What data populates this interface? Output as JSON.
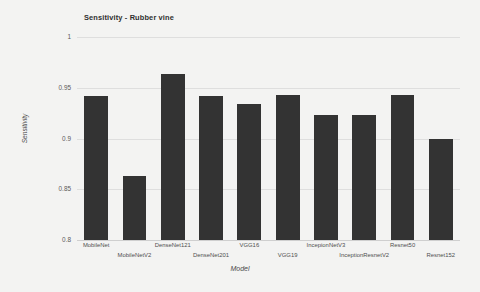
{
  "chart_data": {
    "type": "bar",
    "title": "Sensitivity - Rubber vine",
    "xlabel": "Model",
    "ylabel": "Sensitivity",
    "ylim": [
      0.8,
      1
    ],
    "yticks": [
      "0.8",
      "0.85",
      "0.9",
      "0.95",
      "1"
    ],
    "ytick_values": [
      0.8,
      0.85,
      0.9,
      0.95,
      1
    ],
    "grid": true,
    "legend": "none",
    "bar_color": "#333333",
    "categories": [
      "MobileNet",
      "MobileNetV2",
      "DenseNet121",
      "DenseNet201",
      "VGG16",
      "VGG19",
      "IncepionNetV3",
      "InceptionResnetV2",
      "Resnet50",
      "Resnet152"
    ],
    "values": [
      0.942,
      0.863,
      0.964,
      0.942,
      0.934,
      0.943,
      0.923,
      0.923,
      0.943,
      0.9
    ]
  },
  "colors": {
    "background": "#f3f3f2",
    "bar": "#333333",
    "gridline": "#dedede",
    "text": "#4f4f4f"
  }
}
